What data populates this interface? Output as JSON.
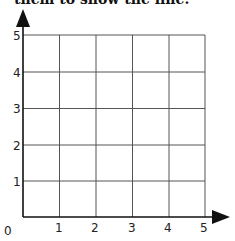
{
  "instruction_fragment": "them to show the line.",
  "grid": {
    "x_ticks": [
      "1",
      "2",
      "3",
      "4",
      "5"
    ],
    "y_ticks": [
      "1",
      "2",
      "3",
      "4",
      "5"
    ],
    "origin_label": "0",
    "x_min": 0,
    "x_max": 5,
    "y_min": 0,
    "y_max": 5
  },
  "colors": {
    "grid": "#555555",
    "axis": "#111111",
    "text": "#222222"
  }
}
